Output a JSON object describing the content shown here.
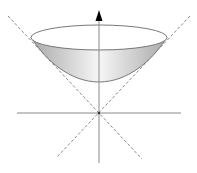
{
  "diagram": {
    "title": "",
    "colors": {
      "background": "#ffffff",
      "axis": "#8a8a8a",
      "dashed": "#8a8a8a",
      "outline": "#7a7a7a",
      "fill_light": "#f4f4f4",
      "fill_dark": "#b8b8b8",
      "arrow": "#000000"
    },
    "axes": {
      "vertical": {
        "label": "",
        "has_arrow": true
      },
      "horizontal": {
        "label": "",
        "has_arrow": false
      }
    },
    "elements": [
      "hyperboloid-sheet",
      "rim-ellipse",
      "asymptote-left",
      "asymptote-right",
      "vertical-axis",
      "horizontal-axis"
    ]
  }
}
